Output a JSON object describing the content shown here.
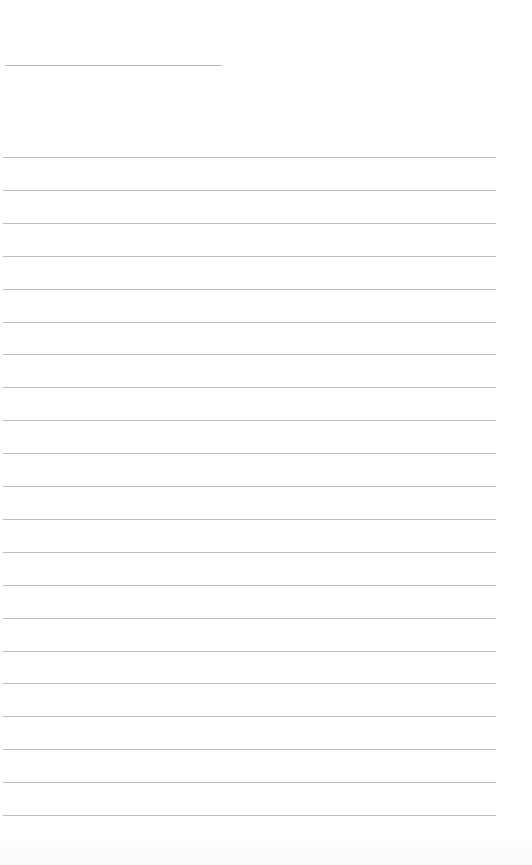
{
  "page": {
    "type": "ruled-sheet",
    "background_color": "#ffffff",
    "line_color": "#bdbdbd",
    "title_line": {
      "x": 5,
      "y": 65,
      "width": 217
    },
    "ruled_lines": {
      "count": 21,
      "start_y": 157,
      "spacing": 32.9,
      "x": 3,
      "width": 493
    }
  }
}
